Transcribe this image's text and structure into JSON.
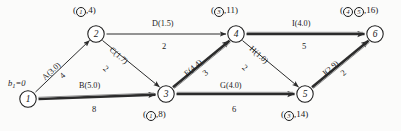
{
  "diagram": {
    "source_label": "b",
    "source_sub": "1",
    "source_value": "=0",
    "nodes": [
      {
        "id": "1",
        "x": 28,
        "y": 99,
        "label_text": "",
        "label_circled": []
      },
      {
        "id": "2",
        "x": 96,
        "y": 34,
        "label_text": ",4)",
        "label_circled": [
          "1"
        ]
      },
      {
        "id": "3",
        "x": 166,
        "y": 94,
        "label_text": ",8)",
        "label_circled": [
          "1"
        ]
      },
      {
        "id": "4",
        "x": 236,
        "y": 34,
        "label_text": ",11)",
        "label_circled": [
          "3"
        ]
      },
      {
        "id": "5",
        "x": 305,
        "y": 94,
        "label_text": ",14)",
        "label_circled": [
          "3"
        ]
      },
      {
        "id": "6",
        "x": 375,
        "y": 34,
        "label_text": ",16)",
        "label_circled": [
          "4",
          "5"
        ]
      }
    ],
    "edges": [
      {
        "name": "A(3.0)",
        "cost": "4",
        "from": "1",
        "to": "2",
        "bold": false
      },
      {
        "name": "B(5.0)",
        "cost": "8",
        "from": "1",
        "to": "3",
        "bold": true
      },
      {
        "name": "C(1.7)",
        "cost": "2",
        "from": "2",
        "to": "3",
        "bold": false
      },
      {
        "name": "D(1.5)",
        "cost": "2",
        "from": "2",
        "to": "4",
        "bold": false
      },
      {
        "name": "E(4.4)",
        "cost": "3",
        "from": "3",
        "to": "4",
        "bold": true
      },
      {
        "name": "G(4.0)",
        "cost": "6",
        "from": "3",
        "to": "5",
        "bold": true
      },
      {
        "name": "H(1.0)",
        "cost": "2",
        "from": "4",
        "to": "5",
        "bold": false
      },
      {
        "name": "I(4.0)",
        "cost": "5",
        "from": "4",
        "to": "6",
        "bold": true
      },
      {
        "name": "J(2.9)",
        "cost": "2",
        "from": "5",
        "to": "6",
        "bold": true
      }
    ],
    "paren_open": "(",
    "paren_close": ")"
  }
}
